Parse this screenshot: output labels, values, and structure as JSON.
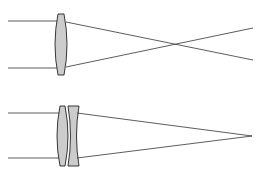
{
  "diagram": {
    "colors": {
      "ray": "#333333",
      "lens_fill": "#cccccc",
      "lens_stroke": "#222222",
      "background": "#ffffff"
    },
    "panels": [
      {
        "name": "single-lens",
        "description": "Converging lens; rays cross and diverge"
      },
      {
        "name": "doublet-lens",
        "description": "Convex + concave doublet; rays converge to focal point"
      }
    ]
  }
}
